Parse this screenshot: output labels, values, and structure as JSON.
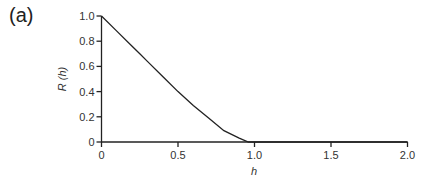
{
  "panel_label": "(a)",
  "chart_data": {
    "type": "line",
    "title": "",
    "xlabel": "h",
    "ylabel": "R (h)",
    "xlim": [
      0,
      2.0
    ],
    "ylim": [
      0,
      1.0
    ],
    "grid": false,
    "legend": null,
    "x_ticks": [
      "0",
      "0.5",
      "1.0",
      "1.5",
      "2.0"
    ],
    "y_ticks": [
      "0",
      "0.2",
      "0.4",
      "0.6",
      "0.8",
      "1.0"
    ],
    "series": [
      {
        "name": "R(h)",
        "x": [
          0,
          0.1,
          0.2,
          0.25,
          0.3,
          0.4,
          0.5,
          0.6,
          0.7,
          0.8,
          0.9,
          0.96,
          1.0,
          1.5,
          2.0
        ],
        "y": [
          1.0,
          0.88,
          0.76,
          0.7,
          0.64,
          0.52,
          0.4,
          0.29,
          0.19,
          0.09,
          0.03,
          0.0,
          0.0,
          0.0,
          0.0
        ]
      }
    ]
  }
}
